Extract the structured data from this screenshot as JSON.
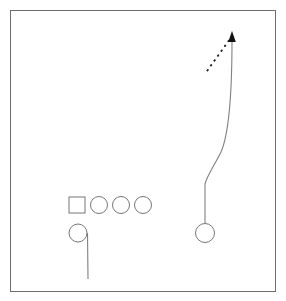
{
  "diagram": {
    "kind": "football-play-diagram",
    "title": "",
    "canvas": {
      "width": 286,
      "height": 301
    },
    "colors": {
      "background": "#ffffff",
      "frame_stroke": "#6e6e6e",
      "shape_stroke": "#777777",
      "shape_fill": "#ffffff",
      "route_stroke": "#808080",
      "motion_stroke": "#2b2b2b",
      "arrow_fill": "#111111"
    },
    "frame": {
      "x": 10,
      "y": 10,
      "width": 266,
      "height": 282,
      "stroke_width": 1
    },
    "players": [
      {
        "id": "lineman-square",
        "label": "",
        "shape": "square",
        "x": 69,
        "y": 197,
        "size": 16,
        "stroke_width": 1
      },
      {
        "id": "lineman-circle-1",
        "label": "",
        "shape": "circle",
        "cx": 99,
        "cy": 205,
        "r": 8.5,
        "stroke_width": 1
      },
      {
        "id": "lineman-circle-2",
        "label": "",
        "shape": "circle",
        "cx": 121,
        "cy": 205,
        "r": 8.5,
        "stroke_width": 1
      },
      {
        "id": "lineman-circle-3",
        "label": "",
        "shape": "circle",
        "cx": 143,
        "cy": 205,
        "r": 8.5,
        "stroke_width": 1
      },
      {
        "id": "backfield-circle",
        "label": "",
        "shape": "circle",
        "cx": 78,
        "cy": 233,
        "r": 9,
        "stroke_width": 1
      },
      {
        "id": "right-receiver-circle",
        "label": "",
        "shape": "circle",
        "cx": 205,
        "cy": 233,
        "r": 9.5,
        "stroke_width": 1
      }
    ],
    "routes": [
      {
        "id": "backfield-stem",
        "style": "solid",
        "stroke_width": 1.1,
        "has_arrowhead": false,
        "path": "M 87.5 233 L 88 279"
      },
      {
        "id": "right-receiver-stem",
        "style": "solid",
        "stroke_width": 1.1,
        "has_arrowhead": true,
        "path": "M 205 223.5 L 205 184 C 207 176 214 166 221 152 C 228 136 232 104 232 40"
      }
    ],
    "motion_paths": [
      {
        "id": "backfield-motion-dashed",
        "style": "dashed",
        "stroke_width": 1.6,
        "dash_pattern": "2 4",
        "has_arrowhead": false,
        "path": "M 88 280 L 106 251"
      },
      {
        "id": "deep-route-motion-dashed",
        "style": "dashed",
        "stroke_width": 1.6,
        "dash_pattern": "2 4",
        "has_arrowhead": false,
        "path": "M 207 71 L 230 39"
      }
    ],
    "arrowheads": [
      {
        "id": "deep-route-arrowhead",
        "points": "232,31 228.2,42 235.8,42",
        "direction": "up"
      }
    ],
    "annotations": []
  }
}
